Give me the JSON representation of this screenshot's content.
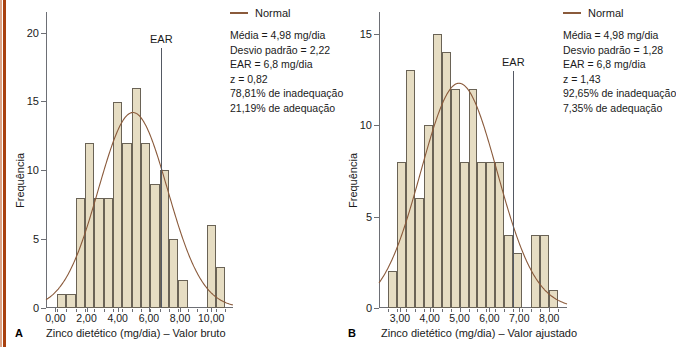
{
  "figure": {
    "background": "#ffffff",
    "bar_fill": "#e6ddc3",
    "bar_stroke": "#6a6356",
    "curve_color": "#8a5a3b",
    "axis_color": "#6d6f75",
    "ear_color": "#545963",
    "edge_stripe_color": "#a8400f"
  },
  "panels": [
    {
      "letter": "A",
      "xlabel": "Zinco dietético (mg/dia) – Valor bruto",
      "ylabel": "Frequência",
      "legend": {
        "curve_label": "Normal",
        "stats": [
          "Média = 4,98 mg/dia",
          "Desvio padrão = 2,22",
          "EAR = 6,8 mg/dia",
          "z = 0,82",
          "78,81% de inadequação",
          "21,19% de adequação"
        ]
      },
      "ear": {
        "label": "EAR",
        "value": 6.8
      },
      "chart_data": {
        "type": "bar",
        "title": "",
        "xlabel": "Zinco dietético (mg/dia) – Valor bruto",
        "ylabel": "Frequência",
        "xlim": [
          -0.6,
          11.4
        ],
        "ylim": [
          0,
          21.5
        ],
        "xticks": [
          0,
          2,
          4,
          6,
          8,
          10
        ],
        "xtick_labels": [
          "0,00",
          "2,00",
          "4,00",
          "6,00",
          "8,00",
          "10,00"
        ],
        "yticks": [
          0,
          5,
          10,
          15,
          20
        ],
        "ytick_labels": [
          "0",
          "5",
          "10",
          "15",
          "20"
        ],
        "grid": false,
        "bin_width": 0.6,
        "bin_starts": [
          0.1,
          0.7,
          1.3,
          1.9,
          2.5,
          3.1,
          3.7,
          4.3,
          4.9,
          5.5,
          6.1,
          6.7,
          7.3,
          7.9,
          8.5,
          9.7,
          10.3
        ],
        "values": [
          1,
          1,
          8,
          12,
          8,
          8,
          15,
          12,
          16,
          12,
          9,
          10,
          5,
          2,
          0,
          6,
          3
        ],
        "series": [
          {
            "name": "Normal",
            "type": "line",
            "mean": 4.98,
            "sd": 2.22,
            "peak_value": 14.2
          }
        ]
      }
    },
    {
      "letter": "B",
      "xlabel": "Zinco dietético (mg/dia) – Valor ajustado",
      "ylabel": "Frequência",
      "legend": {
        "curve_label": "Normal",
        "stats": [
          "Média = 4,98 mg/dia",
          "Desvio padrão = 1,28",
          "EAR = 6,8 mg/dia",
          "z = 1,43",
          "92,65% de inadequação",
          "7,35% de adequação"
        ]
      },
      "ear": {
        "label": "EAR",
        "value": 6.8
      },
      "chart_data": {
        "type": "bar",
        "title": "",
        "xlabel": "Zinco dietético (mg/dia) – Valor ajustado",
        "ylabel": "Frequência",
        "xlim": [
          2.3,
          8.6
        ],
        "ylim": [
          0,
          16.2
        ],
        "xticks": [
          3,
          4,
          5,
          6,
          7,
          8
        ],
        "xtick_labels": [
          "3,00",
          "4,00",
          "5,00",
          "6,00",
          "7,00",
          "8,00"
        ],
        "yticks": [
          0,
          5,
          10,
          15
        ],
        "ytick_labels": [
          "0",
          "5",
          "10",
          "15"
        ],
        "grid": false,
        "bin_width": 0.3,
        "bin_starts": [
          2.6,
          2.9,
          3.2,
          3.5,
          3.8,
          4.1,
          4.4,
          4.7,
          5.0,
          5.3,
          5.6,
          5.9,
          6.2,
          6.5,
          6.8,
          7.4,
          7.7,
          8.0
        ],
        "values": [
          2,
          8,
          13,
          6,
          10,
          15,
          14,
          12,
          8,
          12,
          8,
          8,
          8,
          4,
          3,
          4,
          4,
          1
        ],
        "series": [
          {
            "name": "Normal",
            "type": "line",
            "mean": 4.98,
            "sd": 1.28,
            "peak_value": 12.3
          }
        ]
      }
    }
  ]
}
